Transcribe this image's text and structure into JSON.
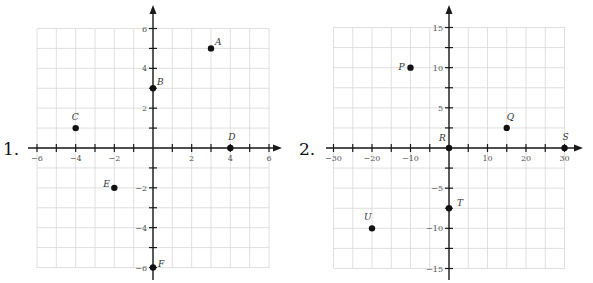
{
  "problems": [
    {
      "number_label": "1.",
      "xlim": [
        -6,
        6
      ],
      "ylim": [
        -6,
        6
      ],
      "grid_step_x": 1,
      "grid_step_y": 1,
      "x_tick_labels": [
        "-6",
        "-4",
        "-2",
        "2",
        "4",
        "6"
      ],
      "y_tick_labels": [
        "6",
        "4",
        "2",
        "-2",
        "-4",
        "-6"
      ],
      "points": [
        {
          "label": "A",
          "x": 3,
          "y": 5
        },
        {
          "label": "B",
          "x": 0,
          "y": 3
        },
        {
          "label": "C",
          "x": -4,
          "y": 1
        },
        {
          "label": "D",
          "x": 4,
          "y": 0
        },
        {
          "label": "E",
          "x": -2,
          "y": -2
        },
        {
          "label": "F",
          "x": 0,
          "y": -6
        }
      ]
    },
    {
      "number_label": "2.",
      "xlim": [
        -30,
        30
      ],
      "ylim": [
        -15,
        15
      ],
      "grid_step_x": 5,
      "grid_step_y": 2.5,
      "x_tick_labels": [
        "-30",
        "-20",
        "-10",
        "10",
        "20",
        "30"
      ],
      "y_tick_labels": [
        "15",
        "10",
        "5",
        "-5",
        "-10",
        "-15"
      ],
      "points": [
        {
          "label": "P",
          "x": -10,
          "y": 10
        },
        {
          "label": "Q",
          "x": 15,
          "y": 2.5
        },
        {
          "label": "R",
          "x": 0,
          "y": 0
        },
        {
          "label": "S",
          "x": 30,
          "y": 0
        },
        {
          "label": "T",
          "x": 0,
          "y": -7.5
        },
        {
          "label": "U",
          "x": -20,
          "y": -10
        }
      ]
    }
  ],
  "chart_data": [
    {
      "type": "scatter",
      "title": "1.",
      "xlim": [
        -6,
        6
      ],
      "ylim": [
        -6,
        6
      ],
      "grid": true,
      "x_ticks": [
        -6,
        -4,
        -2,
        2,
        4,
        6
      ],
      "y_ticks": [
        -6,
        -4,
        -2,
        2,
        4,
        6
      ],
      "series": [
        {
          "name": "points",
          "labels": [
            "A",
            "B",
            "C",
            "D",
            "E",
            "F"
          ],
          "x": [
            3,
            0,
            -4,
            4,
            -2,
            0
          ],
          "y": [
            5,
            3,
            1,
            0,
            -2,
            -6
          ]
        }
      ]
    },
    {
      "type": "scatter",
      "title": "2.",
      "xlim": [
        -30,
        30
      ],
      "ylim": [
        -15,
        15
      ],
      "grid": true,
      "x_ticks": [
        -30,
        -20,
        -10,
        10,
        20,
        30
      ],
      "y_ticks": [
        -15,
        -10,
        -5,
        5,
        10,
        15
      ],
      "series": [
        {
          "name": "points",
          "labels": [
            "P",
            "Q",
            "R",
            "S",
            "T",
            "U"
          ],
          "x": [
            -10,
            15,
            0,
            30,
            0,
            -20
          ],
          "y": [
            10,
            2.5,
            0,
            0,
            -7.5,
            -10
          ]
        }
      ]
    }
  ]
}
